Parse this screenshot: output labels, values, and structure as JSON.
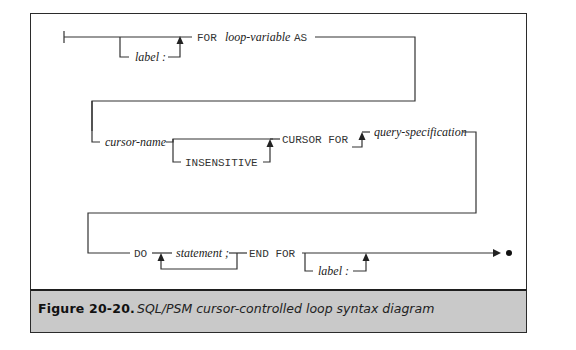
{
  "figure": {
    "number_label": "Figure  20-20.",
    "title": "SQL/PSM cursor-controlled loop syntax diagram"
  },
  "diagram": {
    "type": "syntax-diagram",
    "rows": [
      {
        "optional_prefix": "label :",
        "keywords": [
          "FOR",
          "AS"
        ],
        "terms": [
          "loop-variable"
        ]
      },
      {
        "optional_prefix": "cursor-name",
        "optional_keyword": "INSENSITIVE",
        "keywords": [
          "CURSOR FOR"
        ],
        "terms": [
          "query-specification"
        ]
      },
      {
        "keywords": [
          "DO",
          "END FOR"
        ],
        "repeatable_term": "statement ;",
        "optional_suffix": "label :"
      }
    ],
    "labels": {
      "r1_label": "label :",
      "r1_for": "FOR",
      "r1_loopvar": "loop-variable",
      "r1_as": "AS",
      "r2_cursorname": "cursor-name",
      "r2_insensitive": "INSENSITIVE",
      "r2_cursorfor": "CURSOR FOR",
      "r2_query": "query-specification",
      "r3_do": "DO",
      "r3_statement": "statement ;",
      "r3_endfor": "END FOR",
      "r3_label": "label :"
    }
  }
}
